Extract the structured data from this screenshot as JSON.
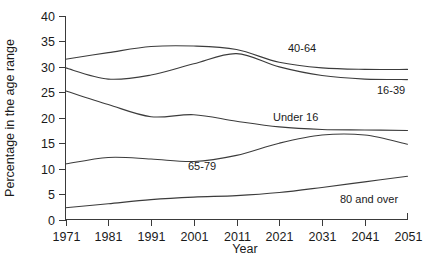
{
  "chart_data": {
    "type": "line",
    "title": "",
    "xlabel": "Year",
    "ylabel": "Percentage in the age range",
    "xlim": [
      1971,
      2051
    ],
    "ylim": [
      0,
      40
    ],
    "grid": false,
    "legend": "inline-labels",
    "x_ticks": [
      "1971",
      "1981",
      "1991",
      "2001",
      "2011",
      "2021",
      "2031",
      "2041",
      "2051"
    ],
    "y_ticks": [
      "0",
      "5",
      "10",
      "15",
      "20",
      "25",
      "30",
      "35",
      "40"
    ],
    "x": [
      1971,
      1981,
      1991,
      2001,
      2011,
      2021,
      2031,
      2041,
      2051
    ],
    "series": [
      {
        "name": "40-64",
        "label": "40-64",
        "values": [
          31.5,
          32.8,
          34.0,
          34.1,
          33.4,
          30.9,
          29.8,
          29.5,
          29.5
        ],
        "color": "#3c3c3c"
      },
      {
        "name": "16-39",
        "label": "16-39",
        "values": [
          29.8,
          27.6,
          28.4,
          30.6,
          32.6,
          30.0,
          28.3,
          27.6,
          27.5
        ],
        "color": "#3c3c3c"
      },
      {
        "name": "Under 16",
        "label": "Under 16",
        "values": [
          25.3,
          22.6,
          20.2,
          20.6,
          19.3,
          18.2,
          17.7,
          17.6,
          17.5
        ],
        "color": "#3c3c3c"
      },
      {
        "name": "65-79",
        "label": "65-79",
        "values": [
          10.9,
          12.2,
          11.9,
          11.4,
          12.6,
          15.0,
          16.6,
          16.6,
          14.8
        ],
        "color": "#3c3c3c"
      },
      {
        "name": "80 and over",
        "label": "80 and over",
        "values": [
          2.3,
          3.1,
          3.9,
          4.4,
          4.7,
          5.3,
          6.3,
          7.4,
          8.5
        ],
        "color": "#3c3c3c"
      }
    ],
    "series_label_positions": [
      {
        "name": "40-64",
        "x": 288,
        "y": 52
      },
      {
        "name": "16-39",
        "x": 377,
        "y": 94
      },
      {
        "name": "Under 16",
        "x": 273,
        "y": 121
      },
      {
        "name": "65-79",
        "x": 188,
        "y": 170
      },
      {
        "name": "80 and over",
        "x": 340,
        "y": 203
      }
    ]
  },
  "axes": {
    "y_title": "Percentage in the age range",
    "x_title": "Year"
  }
}
